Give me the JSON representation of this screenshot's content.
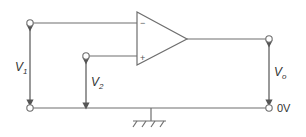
{
  "diagram": {
    "type": "op-amp differential input circuit",
    "labels": {
      "v1": {
        "main": "V",
        "sub": "1"
      },
      "v2": {
        "main": "V",
        "sub": "2"
      },
      "vo": {
        "main": "V",
        "sub": "o"
      },
      "ground_ref": "0V",
      "inverting_input": "−",
      "noninverting_input": "+"
    },
    "colors": {
      "line": "#6e6e6e",
      "text": "#333333",
      "background": "#ffffff"
    }
  }
}
